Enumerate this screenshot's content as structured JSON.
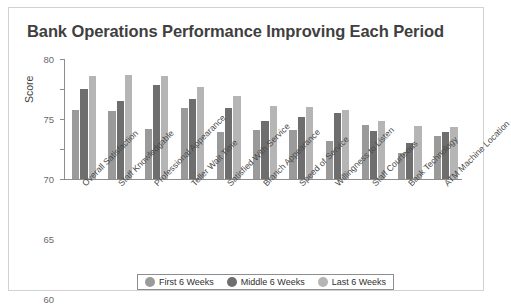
{
  "chart_data": {
    "type": "bar",
    "title": "Bank Operations Performance Improving Each Period",
    "xlabel": "",
    "ylabel": "Score",
    "ylim": [
      60,
      80
    ],
    "yticks": [
      60,
      65,
      70,
      75,
      80
    ],
    "grid": false,
    "legend_position": "bottom",
    "categories": [
      "Overall Satisfaction",
      "Staff Knowledgable",
      "Professional Appearance",
      "Teller Wait Time",
      "Satisfied With Service",
      "Branch Appearance",
      "Speed of Service",
      "Willingness to Listen",
      "Staff Courteous",
      "Bank Technology",
      "ATM Machine Location"
    ],
    "series": [
      {
        "name": "First 6 Weeks",
        "color": "#9a9a9a",
        "values": [
          71.5,
          71.3,
          68.4,
          71.9,
          67.8,
          68.2,
          68.1,
          66.4,
          69.0,
          64.3,
          67.2
        ]
      },
      {
        "name": "Middle 6 Weeks",
        "color": "#6e6e6e",
        "values": [
          75.0,
          73.0,
          75.6,
          73.4,
          71.8,
          69.6,
          70.4,
          71.0,
          68.0,
          66.0,
          67.9
        ]
      },
      {
        "name": "Last 6 Weeks",
        "color": "#b5b5b5",
        "values": [
          77.2,
          77.3,
          77.1,
          75.3,
          73.9,
          72.2,
          72.0,
          71.5,
          69.6,
          68.8,
          68.6
        ]
      }
    ]
  },
  "legend": {
    "items": [
      {
        "label": "First 6 Weeks",
        "color": "#9a9a9a"
      },
      {
        "label": "Middle 6 Weeks",
        "color": "#6e6e6e"
      },
      {
        "label": "Last 6 Weeks",
        "color": "#b5b5b5"
      }
    ]
  },
  "colors": {
    "frame_border": "#d2d2d2",
    "axis": "#8d8d8d",
    "title_text": "#3f3f3f",
    "tick_text": "#6a6a6a",
    "category_text": "#4a4a4a"
  }
}
